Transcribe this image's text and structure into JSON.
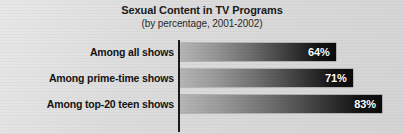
{
  "chart_data": {
    "type": "bar",
    "orientation": "horizontal",
    "title": "Sexual Content in TV Programs",
    "subtitle": "(by percentage, 2001-2002)",
    "xlabel": "",
    "ylabel": "",
    "xlim": [
      0,
      100
    ],
    "grid": false,
    "legend": false,
    "unit": "%",
    "categories": [
      "Among all shows",
      "Among prime-time shows",
      "Among top-20 teen shows"
    ],
    "values": [
      64,
      71,
      83
    ],
    "value_labels": [
      "64%",
      "71%",
      "83%"
    ],
    "bars": [
      {
        "category": "Among all shows",
        "value": 64,
        "label": "64%"
      },
      {
        "category": "Among prime-time shows",
        "value": 71,
        "label": "71%"
      },
      {
        "category": "Among top-20 teen shows",
        "value": 83,
        "label": "83%"
      }
    ],
    "colors": {
      "background": "#dcdcdc",
      "bar_gradient_start": "#b6b6b6",
      "bar_gradient_end": "#0b0b0b",
      "axis": "#1c1c1c",
      "title_text": "#1b1b1b",
      "category_text": "#141414",
      "value_text": "#ffffff"
    }
  }
}
